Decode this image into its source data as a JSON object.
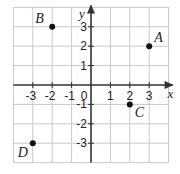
{
  "chart_data": {
    "type": "scatter",
    "title": "",
    "xlabel": "x",
    "ylabel": "y",
    "xlim": [
      -4,
      4
    ],
    "ylim": [
      -4,
      4
    ],
    "grid": true,
    "legend": null,
    "x_ticks": [
      "-3",
      "-2",
      "-1",
      "0",
      "1",
      "2",
      "3"
    ],
    "y_ticks": [
      "3",
      "2",
      "1",
      "-1",
      "-2",
      "-3"
    ],
    "points": [
      {
        "label": "A",
        "x": 3,
        "y": 2
      },
      {
        "label": "B",
        "x": -2,
        "y": 3
      },
      {
        "label": "C",
        "x": 2,
        "y": -1
      },
      {
        "label": "D",
        "x": -3,
        "y": -3
      }
    ]
  },
  "colors": {
    "grid": "#c8c8c8",
    "axis": "#333333",
    "point": "#111111"
  }
}
